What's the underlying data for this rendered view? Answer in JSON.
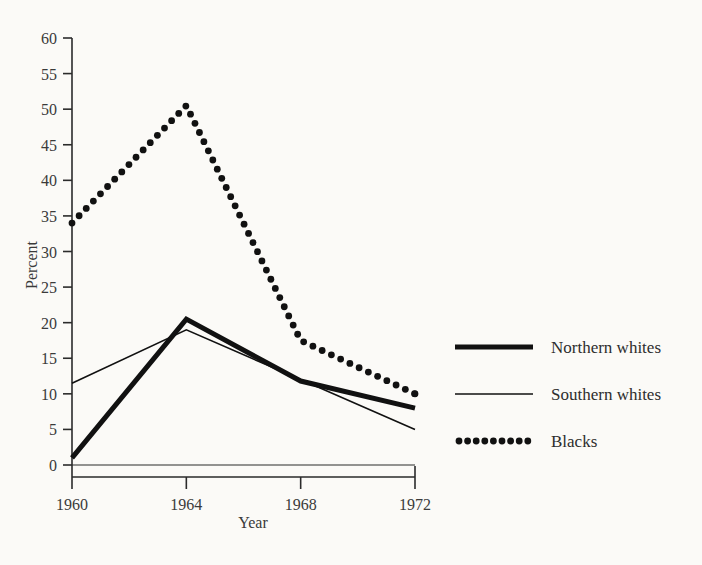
{
  "chart_data": {
    "type": "line",
    "title": "",
    "xlabel": "Year",
    "ylabel": "Percent",
    "categories": [
      "1960",
      "1964",
      "1968",
      "1972"
    ],
    "x": [
      1960,
      1964,
      1968,
      1972
    ],
    "xlim": [
      1960,
      1972
    ],
    "ylim": [
      0,
      60
    ],
    "yticks": [
      0,
      5,
      10,
      15,
      20,
      25,
      30,
      35,
      40,
      45,
      50,
      55,
      60
    ],
    "xticks": [
      1960,
      1964,
      1968,
      1972
    ],
    "grid": false,
    "legend_position": "right",
    "series": [
      {
        "name": "Northern whites",
        "style": "thick-solid",
        "color": "#111111",
        "values": [
          1,
          20.5,
          11.8,
          8
        ]
      },
      {
        "name": "Southern whites",
        "style": "thin-solid",
        "color": "#111111",
        "values": [
          11.5,
          19,
          12,
          5
        ]
      },
      {
        "name": "Blacks",
        "style": "dotted",
        "color": "#111111",
        "values": [
          34,
          50.5,
          17.5,
          10
        ]
      }
    ]
  },
  "axes": {
    "y_label": "Percent",
    "x_label": "Year",
    "y_tick_labels": [
      "0",
      "5",
      "10",
      "15",
      "20",
      "25",
      "30",
      "35",
      "40",
      "45",
      "50",
      "55",
      "60"
    ],
    "x_tick_labels": [
      "1960",
      "1964",
      "1968",
      "1972"
    ]
  },
  "legend": {
    "entries": [
      {
        "label": "Northern whites",
        "marker": "thick-line-swatch"
      },
      {
        "label": "Southern whites",
        "marker": "thin-line-swatch"
      },
      {
        "label": "Blacks",
        "marker": "dotted-line-swatch"
      }
    ]
  },
  "colors": {
    "ink": "#111111",
    "paper": "#fbfaf7",
    "axis": "#2b2b2b",
    "label": "#3a3a3a"
  }
}
